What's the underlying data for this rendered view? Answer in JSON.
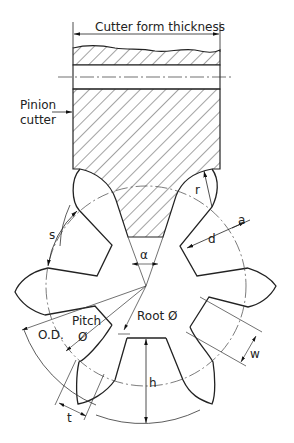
{
  "diagram": {
    "type": "gear-cutting-diagram",
    "colors": {
      "line": "#222222",
      "background": "#ffffff"
    },
    "labels": {
      "cutter_form_thickness": "Cutter form thickness",
      "pinion_cutter_line1": "Pinion",
      "pinion_cutter_line2": "cutter",
      "s": "s",
      "r": "r",
      "a": "a",
      "d": "d",
      "alpha": "α",
      "outside_diameter": "O.D.",
      "pitch_line1": "Pitch",
      "pitch_line2": "Ø",
      "root_diameter": "Root Ø",
      "w": "w",
      "h": "h",
      "t": "t"
    }
  }
}
